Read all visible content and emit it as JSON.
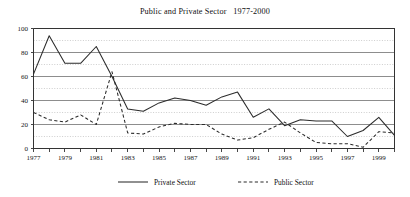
{
  "chart_data": {
    "type": "line",
    "title": "Public and Private Sector   1977-2000",
    "xlabel": "",
    "ylabel": "",
    "xlim": [
      1977,
      2000
    ],
    "ylim": [
      0,
      100
    ],
    "ytick_labels": [
      "0",
      "20",
      "40",
      "60",
      "80",
      "100"
    ],
    "ytick_values": [
      0,
      20,
      40,
      60,
      80,
      100
    ],
    "yminor_values": [
      10,
      30,
      50,
      70,
      90
    ],
    "grid": true,
    "legend_position": "bottom",
    "x": [
      1977,
      1978,
      1979,
      1980,
      1981,
      1982,
      1983,
      1984,
      1985,
      1986,
      1987,
      1988,
      1989,
      1990,
      1991,
      1992,
      1993,
      1994,
      1995,
      1996,
      1997,
      1998,
      1999,
      2000
    ],
    "xtick_labels": [
      "1977",
      "",
      "1979",
      "",
      "1981",
      "",
      "1983",
      "",
      "1985",
      "",
      "1987",
      "",
      "1989",
      "",
      "1991",
      "",
      "1993",
      "",
      "1995",
      "",
      "1997",
      "",
      "1999",
      ""
    ],
    "series": [
      {
        "name": "Private Sector",
        "style": "solid",
        "values": [
          62,
          94,
          71,
          71,
          85,
          60,
          33,
          31,
          38,
          42,
          40,
          36,
          43,
          47,
          26,
          33,
          19,
          24,
          23,
          23,
          10,
          15,
          26,
          11
        ]
      },
      {
        "name": "Public Sector",
        "style": "dashed",
        "values": [
          30,
          24,
          22,
          28,
          20,
          64,
          13,
          12,
          18,
          21,
          20,
          20,
          12,
          7,
          9,
          16,
          22,
          13,
          5,
          4,
          4,
          1,
          14,
          13
        ]
      }
    ]
  },
  "legend": {
    "items": [
      {
        "label": "Private Sector",
        "style": "solid"
      },
      {
        "label": "Public Sector",
        "style": "dashed"
      }
    ]
  }
}
